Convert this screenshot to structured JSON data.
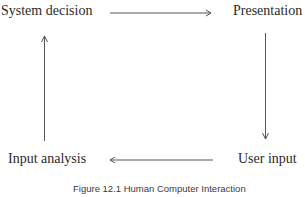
{
  "diagram": {
    "nodes": {
      "system_decision": "System decision",
      "presentation": "Presentation",
      "user_input": "User input",
      "input_analysis": "Input analysis"
    },
    "edges": [
      {
        "from": "System decision",
        "to": "Presentation",
        "direction": "right"
      },
      {
        "from": "Presentation",
        "to": "User input",
        "direction": "down"
      },
      {
        "from": "User input",
        "to": "Input analysis",
        "direction": "left"
      },
      {
        "from": "Input analysis",
        "to": "System decision",
        "direction": "up"
      }
    ],
    "caption": "Figure 12.1  Human Computer Interaction"
  }
}
